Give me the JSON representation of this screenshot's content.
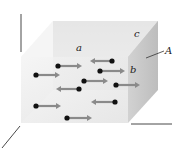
{
  "figure": {
    "labels": {
      "a": "a",
      "b": "b",
      "c": "c",
      "A": "A"
    },
    "colors": {
      "front_face": "#ececec",
      "top_face": "#f4f4f4",
      "back_face": "#d6d6d6",
      "right_face": "#c8c8c8",
      "molecule": "#111111",
      "arrow": "#8a8a8a",
      "axis": "#333333"
    },
    "molecules": [
      {
        "x": 58,
        "y": 66,
        "direction": "right",
        "arrow_end": 82
      },
      {
        "x": 112,
        "y": 61,
        "direction": "left",
        "arrow_end": 90
      },
      {
        "x": 36,
        "y": 75,
        "direction": "right",
        "arrow_end": 60
      },
      {
        "x": 100,
        "y": 71,
        "direction": "right",
        "arrow_end": 125
      },
      {
        "x": 84,
        "y": 81,
        "direction": "right",
        "arrow_end": 108
      },
      {
        "x": 116,
        "y": 85,
        "direction": "right",
        "arrow_end": 140
      },
      {
        "x": 79,
        "y": 89,
        "direction": "left",
        "arrow_end": 56
      },
      {
        "x": 36,
        "y": 106,
        "direction": "right",
        "arrow_end": 61
      },
      {
        "x": 115,
        "y": 102,
        "direction": "left",
        "arrow_end": 91
      },
      {
        "x": 67,
        "y": 118,
        "direction": "right",
        "arrow_end": 92
      }
    ]
  }
}
